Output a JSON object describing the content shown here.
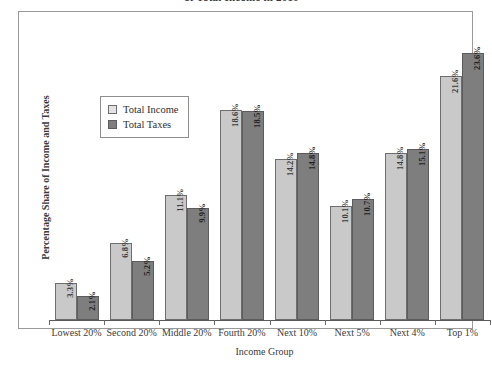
{
  "chart_data": {
    "type": "bar",
    "title": "of Total Income in 2010",
    "xlabel": "Income Group",
    "ylabel": "Percentage Share of Income and Taxes",
    "categories": [
      "Lowest 20%",
      "Second 20%",
      "Middle 20%",
      "Fourth 20%",
      "Next 10%",
      "Next 5%",
      "Next 4%",
      "Top 1%"
    ],
    "ylim": [
      0,
      26
    ],
    "grid": false,
    "legend_position": "upper-left-inside",
    "series": [
      {
        "name": "Total Income",
        "color": "#c9c9c9",
        "values": [
          3.3,
          6.8,
          11.1,
          18.6,
          14.2,
          10.1,
          14.8,
          21.6
        ],
        "labels": [
          "3.3%",
          "6.8%",
          "11.1%",
          "18.6%",
          "14.2%",
          "10.1%",
          "14.8%",
          "21.6%"
        ]
      },
      {
        "name": "Total Taxes",
        "color": "#7e7e7e",
        "values": [
          2.1,
          5.2,
          9.9,
          18.5,
          14.8,
          10.7,
          15.1,
          23.6
        ],
        "labels": [
          "2.1%",
          "5.2%",
          "9.9%",
          "18.5%",
          "14.8%",
          "10.7%",
          "15.1%",
          "23.6%"
        ]
      }
    ]
  },
  "legend": {
    "items": [
      {
        "label": "Total Income"
      },
      {
        "label": "Total Taxes"
      }
    ]
  }
}
